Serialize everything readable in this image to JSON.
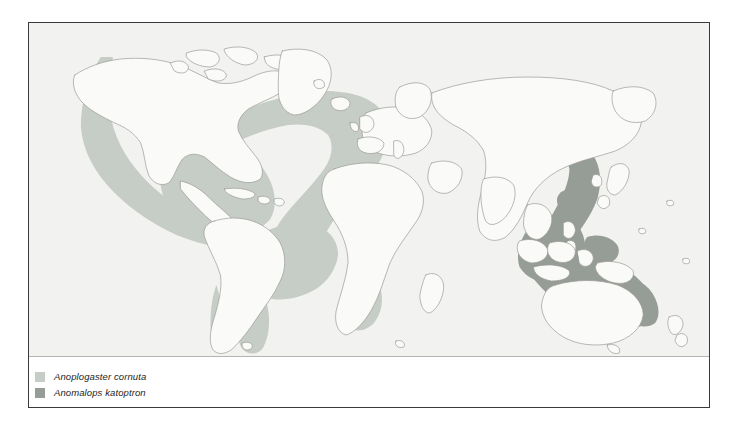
{
  "figure": {
    "kind": "distribution-map",
    "frame_color": "#3a3a3a"
  },
  "map": {
    "projection": "world-equirectangular",
    "ocean_color": "#f2f2f0",
    "land_color": "#fafaf8",
    "coastline_color": "#9a9a96",
    "graticule": "none"
  },
  "ranges": [
    {
      "id": "anoplogaster-cornuta",
      "label": "Anoplogaster cornuta",
      "color": "#c6ccc6",
      "regions": [
        "North Pacific along North American coast",
        "Gulf of Mexico and Caribbean",
        "North Atlantic horseshoe",
        "Eastern South America / Brazil / Argentina coast",
        "Narrow strip along Chile",
        "Southwest Africa / Benguela"
      ]
    },
    {
      "id": "anomalops-katoptron",
      "label": "Anomalops katoptron",
      "color": "#969c96",
      "regions": [
        "Japan south to Philippines",
        "Indonesian archipelago",
        "Coral Sea and Great Barrier Reef",
        "Western tropical Pacific"
      ]
    }
  ],
  "legend": {
    "items": [
      {
        "label": "Anoplogaster cornuta",
        "color": "#c6ccc6"
      },
      {
        "label": "Anomalops katoptron",
        "color": "#969c96"
      }
    ]
  }
}
